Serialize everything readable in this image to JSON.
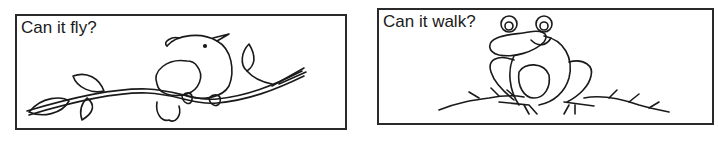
{
  "panels": [
    {
      "question": "Can it fly?",
      "illustration": "bird-on-branch"
    },
    {
      "question": "Can it walk?",
      "illustration": "frog-on-grass"
    }
  ]
}
